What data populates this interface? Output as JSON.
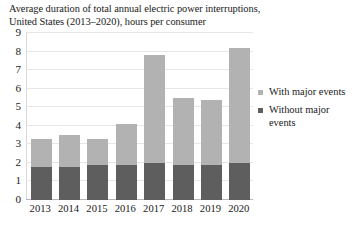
{
  "chart_data": {
    "type": "bar",
    "stacked": true,
    "title": "Average duration of total annual electric power interruptions, United States (2013–2020), hours per consumer",
    "title_lines": [
      "Average duration of total annual electric power interruptions,",
      "United States (2013–2020), hours per consumer"
    ],
    "xlabel": "",
    "ylabel": "",
    "categories": [
      "2013",
      "2014",
      "2015",
      "2016",
      "2017",
      "2018",
      "2019",
      "2020"
    ],
    "series": [
      {
        "name": "Without major events",
        "color": "#5e5e5e",
        "values": [
          1.8,
          1.8,
          1.9,
          1.9,
          2.0,
          1.9,
          1.9,
          2.0
        ]
      },
      {
        "name": "With major events",
        "color": "#b2b2b2",
        "values": [
          1.5,
          1.7,
          1.4,
          2.2,
          5.8,
          3.6,
          3.5,
          6.2
        ]
      }
    ],
    "totals": [
      3.3,
      3.5,
      3.3,
      4.1,
      7.8,
      5.5,
      5.4,
      8.2
    ],
    "ylim": [
      0,
      9
    ],
    "yticks": [
      0,
      1,
      2,
      3,
      4,
      5,
      6,
      7,
      8,
      9
    ],
    "ytick_labels": [
      "0",
      "1",
      "2",
      "3",
      "4",
      "5",
      "6",
      "7",
      "8",
      "9"
    ],
    "grid": true,
    "grid_axis": "y",
    "legend_position": "right",
    "legend": [
      {
        "label": "With major events",
        "color": "#b2b2b2"
      },
      {
        "label": "Without major events",
        "color": "#5e5e5e"
      }
    ]
  }
}
